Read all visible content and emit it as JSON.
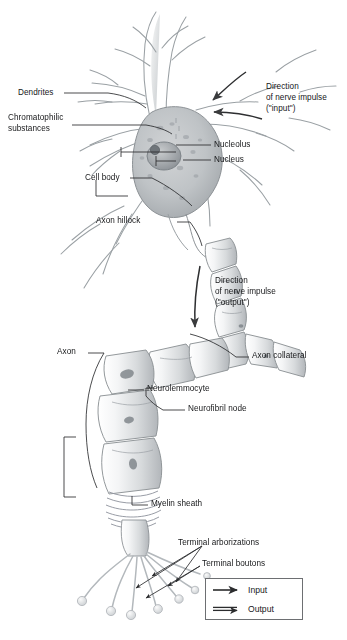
{
  "figure": {
    "background": "#ffffff",
    "ink": "#17181a",
    "art_stroke": "#8e9296",
    "art_fill_light": "#f3f4f5",
    "art_fill_mid": "#d9dbdd",
    "art_fill_dark": "#a9adb1"
  },
  "labels": {
    "dendrites": "Dendrites",
    "chromatophilic_1": "Chromatophilic",
    "chromatophilic_2": "substances",
    "cell_body": "Cell body",
    "nucleolus": "Nucleolus",
    "nucleus": "Nucleus",
    "axon_hillock": "Axon hillock",
    "axon": "Axon",
    "axon_collateral": "Axon collateral",
    "neurolemmocyte": "Neurolemmocyte",
    "neurofibril_node": "Neurofibril node",
    "myelin_sheath": "Myelin sheath",
    "terminal_arborizations": "Terminal arborizations",
    "terminal_boutons": "Terminal boutons",
    "input_dir_1": "Direction",
    "input_dir_2": "of nerve impulse",
    "input_dir_3": "(\"input\")",
    "output_dir_1": "Direction",
    "output_dir_2": "of nerve impulse",
    "output_dir_3": "(\"output\")"
  },
  "legend": {
    "items": [
      {
        "label": "Input",
        "glyph": "arrow-right-single"
      },
      {
        "label": "Output",
        "glyph": "arrow-right-double"
      }
    ]
  }
}
